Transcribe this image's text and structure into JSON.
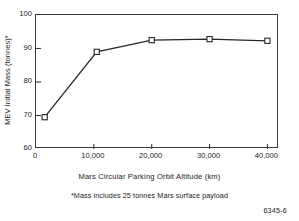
{
  "figure": {
    "id_label": "6345-6",
    "footnote": "*Mass includes 25 tonnes Mars surface payload"
  },
  "chart_data": {
    "type": "line",
    "title": "",
    "xlabel": "Mars Circular Parking Orbit Altitude (km)",
    "ylabel": "MEV Initial Mass (tonnes)*",
    "xlim": [
      0,
      42000
    ],
    "ylim": [
      60,
      100
    ],
    "grid": false,
    "legend": null,
    "marker": "open-square",
    "line_color": "#262626",
    "marker_fill": "#ffffff",
    "x": [
      1500,
      10500,
      20000,
      30000,
      40000
    ],
    "values": [
      69.5,
      89.0,
      92.5,
      92.8,
      92.3
    ],
    "series": [
      {
        "name": "MEV Initial Mass",
        "x": [
          1500,
          10500,
          20000,
          30000,
          40000
        ],
        "values": [
          69.5,
          89.0,
          92.5,
          92.8,
          92.3
        ]
      }
    ],
    "xticks": [
      0,
      10000,
      20000,
      30000,
      40000
    ],
    "xticklabels": [
      "0",
      "10,000",
      "20,000",
      "30,000",
      "40,000"
    ],
    "yticks": [
      60,
      70,
      80,
      90,
      100
    ],
    "yticklabels": [
      "60",
      "70",
      "80",
      "90",
      "100"
    ],
    "annotations": [
      "*Mass includes 25 tonnes Mars surface payload"
    ]
  }
}
